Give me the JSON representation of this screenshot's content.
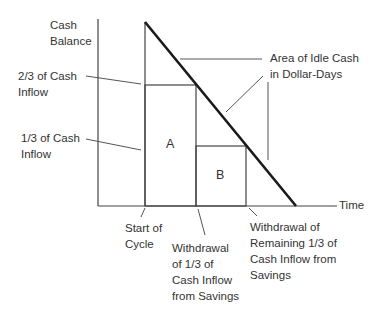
{
  "diagram": {
    "axes": {
      "y_label": "Cash\nBalance",
      "x_label": "Time"
    },
    "left_labels": {
      "two_thirds": "2/3 of Cash\nInflow",
      "one_third": "1/3 of Cash\nInflow"
    },
    "regions": {
      "a": "A",
      "b": "B"
    },
    "idle_cash_label": "Area of Idle Cash\nin Dollar-Days",
    "bottom_labels": {
      "start": "Start of\nCycle",
      "first_withdrawal": "Withdrawal\nof 1/3 of\nCash Inflow\nfrom Savings",
      "second_withdrawal": "Withdrawal of\nRemaining 1/3 of\nCash Inflow from\nSavings"
    },
    "colors": {
      "line": "#444444",
      "diagonal": "#1a1a1a",
      "text": "#333333"
    }
  }
}
